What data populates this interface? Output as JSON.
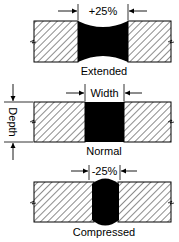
{
  "diagram": {
    "panels": [
      {
        "id": "extended",
        "caption": "Extended",
        "dimension_label": "+25%",
        "sealant_shape": "concave"
      },
      {
        "id": "normal",
        "caption": "Normal",
        "dimension_label": "Width",
        "side_label": "Depth",
        "sealant_shape": "rectangular"
      },
      {
        "id": "compressed",
        "caption": "Compressed",
        "dimension_label": "-25%",
        "sealant_shape": "convex"
      }
    ],
    "colors": {
      "line": "#000000",
      "sealant": "#000000",
      "background": "#ffffff"
    }
  }
}
